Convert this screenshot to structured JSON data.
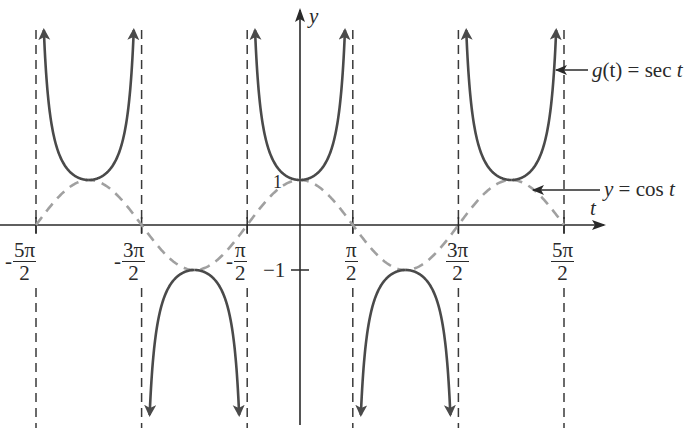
{
  "chart_data": {
    "type": "line",
    "title": "",
    "xlabel": "t",
    "ylabel": "y",
    "xlim": [
      -2.5,
      2.5
    ],
    "x_units": "multiples of pi",
    "ylim": [
      -3.0,
      4.3
    ],
    "grid": false,
    "x_ticks": [
      {
        "value": -2.5,
        "sign": "-",
        "num": "5π",
        "den": "2"
      },
      {
        "value": -1.5,
        "sign": "-",
        "num": "3π",
        "den": "2"
      },
      {
        "value": -0.5,
        "sign": "-",
        "num": "π",
        "den": "2"
      },
      {
        "value": 0.5,
        "sign": "",
        "num": "π",
        "den": "2"
      },
      {
        "value": 1.5,
        "sign": "",
        "num": "3π",
        "den": "2"
      },
      {
        "value": 2.5,
        "sign": "",
        "num": "5π",
        "den": "2"
      }
    ],
    "y_ticks": [
      {
        "value": 1,
        "label": "1"
      },
      {
        "value": -1,
        "label": "−1"
      }
    ],
    "vertical_asymptotes": [
      "-5π/2",
      "-3π/2",
      "-π/2",
      "π/2",
      "3π/2",
      "5π/2"
    ],
    "series": [
      {
        "name": "g(t) = sec t",
        "style": "solid",
        "color": "#4a4a4a",
        "points_description": "Branches opening upward on (-5π/2,-3π/2), (-π/2,π/2), (3π/2,5π/2) with minimum 1 at t=-2π,0,2π; branches opening downward on (-3π/2,-π/2), (π/2,3π/2) with maximum -1 at t=-π,π",
        "x": [
          -2.0,
          -1.0,
          0.0,
          1.0,
          2.0
        ],
        "y": [
          1,
          -1,
          1,
          -1,
          1
        ]
      },
      {
        "name": "y = cos t",
        "style": "dashed",
        "color": "#a0a0a0",
        "x": [
          -2.5,
          -2.0,
          -1.5,
          -1.0,
          -0.5,
          0.0,
          0.5,
          1.0,
          1.5,
          2.0,
          2.5
        ],
        "y": [
          0,
          1,
          0,
          -1,
          0,
          1,
          0,
          -1,
          0,
          1,
          0
        ]
      }
    ],
    "annotations": [
      {
        "text": "g(t) = sec t",
        "points_to": "sec branch near t=5π/2"
      },
      {
        "text": "y = cos t",
        "points_to": "cos curve near t=9π/4"
      }
    ],
    "legend": "none (inline arrow annotations on right)"
  },
  "labels": {
    "y_axis": "y",
    "t_axis": "t",
    "y_one": "1",
    "y_neg_one": "−1",
    "sec_annotation_lhs": "g",
    "sec_annotation_paren": "(t) = sec ",
    "sec_annotation_t": "t",
    "cos_annotation_y": "y",
    "cos_annotation_mid": " = cos ",
    "cos_annotation_t": "t"
  },
  "colors": {
    "sec_curve": "#4a4a4a",
    "cos_curve": "#a0a0a0",
    "axes": "#2a2a2a",
    "asymptote": "#3a3a3a"
  }
}
